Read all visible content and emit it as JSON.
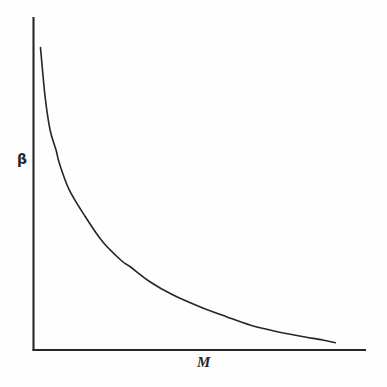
{
  "figure": {
    "background_color": "#fefefe",
    "ink_color": "#262626",
    "width": 387,
    "height": 387
  },
  "labels": {
    "y_axis": "β",
    "x_axis": "M"
  },
  "chart_data": {
    "type": "line",
    "title": "",
    "xlabel": "M",
    "ylabel": "β",
    "grid": false,
    "legend": null,
    "axis_style": "two-spine L-shaped axes, no tick marks, no tick labels",
    "xlim": [
      0,
      1
    ],
    "ylim": [
      0,
      1
    ],
    "x": [
      0.021,
      0.035,
      0.05,
      0.068,
      0.078,
      0.108,
      0.156,
      0.208,
      0.265,
      0.291,
      0.35,
      0.42,
      0.5,
      0.58,
      0.651,
      0.72,
      0.8,
      0.87,
      0.908
    ],
    "y": [
      0.908,
      0.76,
      0.66,
      0.6,
      0.56,
      0.48,
      0.4,
      0.325,
      0.268,
      0.25,
      0.205,
      0.165,
      0.13,
      0.1,
      0.075,
      0.058,
      0.042,
      0.03,
      0.022
    ],
    "series": [
      {
        "name": "beta(M)",
        "color": "#262626",
        "linewidth": 1.6,
        "points": [
          [
            0.021,
            0.908
          ],
          [
            0.035,
            0.76
          ],
          [
            0.05,
            0.66
          ],
          [
            0.068,
            0.6
          ],
          [
            0.078,
            0.56
          ],
          [
            0.108,
            0.48
          ],
          [
            0.156,
            0.4
          ],
          [
            0.208,
            0.325
          ],
          [
            0.265,
            0.268
          ],
          [
            0.291,
            0.25
          ],
          [
            0.35,
            0.205
          ],
          [
            0.42,
            0.165
          ],
          [
            0.5,
            0.13
          ],
          [
            0.58,
            0.1
          ],
          [
            0.651,
            0.075
          ],
          [
            0.72,
            0.058
          ],
          [
            0.8,
            0.042
          ],
          [
            0.87,
            0.03
          ],
          [
            0.908,
            0.022
          ]
        ]
      }
    ]
  }
}
